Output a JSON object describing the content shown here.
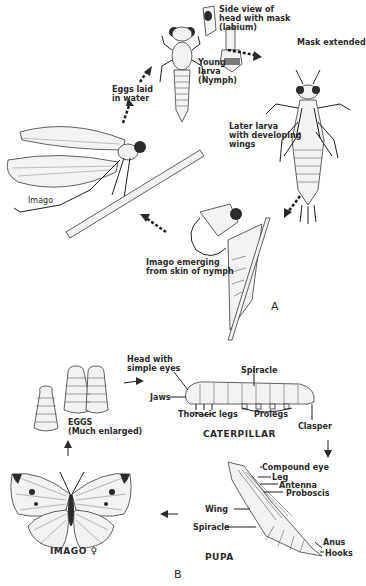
{
  "panel_a": {
    "label": "A",
    "stages": {
      "eggs": "Eggs laid in water",
      "young_larva": "Young larva (Nymph)",
      "side_view": "Side view of head with mask (labium)",
      "mask_extended": "Mask extended",
      "later_larva": "Later larva with developing wings",
      "emerging": "Imago emerging from skin of nymph",
      "imago": "Imago"
    },
    "lines": {
      "eggs_1": "Eggs laid",
      "eggs_2": "in water",
      "side_1": "Side view of",
      "side_2": "head with mask",
      "side_3": "(labium)",
      "young_1": "Young",
      "young_2": "larva",
      "young_3": "(Nymph)",
      "later_1": "Later larva",
      "later_2": "with developing",
      "later_3": "wings",
      "emerge_1": "Imago emerging",
      "emerge_2": "from skin of nymph"
    }
  },
  "panel_b": {
    "label": "B",
    "eggs_1": "EGGS",
    "eggs_2": "(Much enlarged)",
    "caterpillar": {
      "title": "CATERPILLAR",
      "head_1": "Head with",
      "head_2": "simple eyes",
      "jaws": "Jaws",
      "thoracic_legs": "Thoracic legs",
      "spiracle": "Spiracle",
      "prolegs": "Prolegs",
      "clasper": "Clasper"
    },
    "pupa": {
      "title": "PUPA",
      "compound_eye": "Compound eye",
      "leg": "Leg",
      "antenna": "Antenna",
      "proboscis": "Proboscis",
      "wing": "Wing",
      "spiracle": "Spiracle",
      "anus": "Anus",
      "hooks": "Hooks"
    },
    "imago": "IMAGO ♀"
  }
}
